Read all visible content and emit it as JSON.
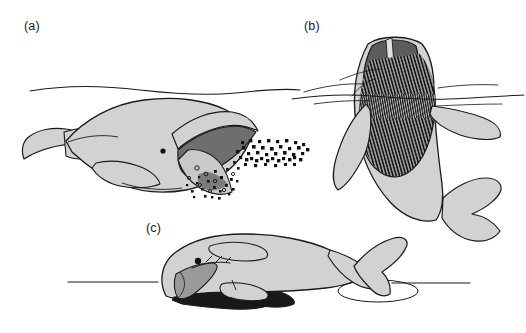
{
  "figure": {
    "type": "scientific-illustration",
    "background_color": "#ffffff",
    "width": 526,
    "height": 333,
    "line_color": "#1a1a1a",
    "palette": {
      "body_light_gray": "#d2d2d2",
      "body_mid_gray": "#b4b4b4",
      "mouth_dark_gray": "#6e6e6e",
      "rostrum_dark_gray": "#5c5c5c",
      "baleen_black": "#141414",
      "sediment_black": "#181818",
      "outline": "#1a1a1a",
      "water_line": "#1a1a1a"
    }
  },
  "panels": [
    {
      "id": "a",
      "label": "(a)",
      "label_x": 24,
      "label_y": 19,
      "feeding_mode": "skim feeding",
      "whale": "bowhead / right whale",
      "orientation": "horizontal, head to the right",
      "water_line": "undulating surface line across upper panel",
      "features": [
        "open mouth with arched upper jaw",
        "dark gray oral cavity",
        "dense black plankton swarm streaming into mouth",
        "eye dot",
        "pectoral flipper",
        "tail fluke at left"
      ]
    },
    {
      "id": "b",
      "label": "(b)",
      "label_x": 304,
      "label_y": 19,
      "feeding_mode": "lunge / gulp feeding",
      "whale": "rorqual / humpback whale",
      "orientation": "near-vertical, head up breaking surface",
      "water_line": "horizontal surface line with splash ripples",
      "features": [
        "dark gray rostrum with pale median ridge",
        "expanded pleated throat pouch with vertical black striations",
        "black baleen fringe",
        "two long pectoral flippers",
        "tail fluke at lower right"
      ]
    },
    {
      "id": "c",
      "label": "(c)",
      "label_x": 146,
      "label_y": 221,
      "feeding_mode": "bottom / suction feeding",
      "whale": "gray whale",
      "orientation": "horizontal, head to the left, rolled on side",
      "water_line": "straight horizontal surface line",
      "features": [
        "eye dot",
        "mid gray baleen plate hanging from jaw",
        "dark near-black sediment / mud plume",
        "blowhole crease",
        "pectoral flipper",
        "tail fluke breaking surface with elliptical ripple"
      ]
    }
  ]
}
